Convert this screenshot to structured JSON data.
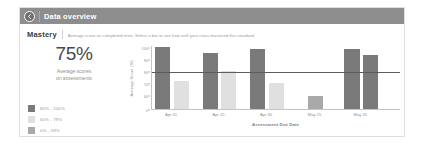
{
  "header": {
    "back_icon": "back-arrow-icon",
    "title": "Data overview"
  },
  "section": {
    "title": "Mastery",
    "description": "Average score on completed tests. Select a bar to see how well your class mastered this standard."
  },
  "summary": {
    "value": "75%",
    "caption_line1": "Average scores",
    "caption_line2": "on assessments"
  },
  "legend": {
    "items": [
      {
        "label": "80% - 100%",
        "color": "#7a7a7a"
      },
      {
        "label": "60% - 79%",
        "color": "#e0e0e0"
      },
      {
        "label": "0% - 59%",
        "color": "#a9a9a9"
      }
    ]
  },
  "chart_data": {
    "type": "bar",
    "title": "",
    "xlabel": "Assessment Due Date",
    "ylabel": "Average Score (%)",
    "ylim": [
      0,
      100
    ],
    "yticks": [
      "100",
      "90",
      "80",
      "70",
      "60",
      "0"
    ],
    "grid": false,
    "legend_position": "left",
    "threshold": 80,
    "categories": [
      "Apr 01",
      "Apr 15",
      "Apr 30",
      "May 15",
      "May 31"
    ],
    "bars": [
      {
        "label": "Apr 01",
        "value": 100,
        "band": "80% - 100%",
        "color": "#7a7a7a"
      },
      {
        "label": "Apr 01",
        "value": 72,
        "band": "60% - 79%",
        "color": "#e0e0e0"
      },
      {
        "label": "Apr 15",
        "value": 95,
        "band": "80% - 100%",
        "color": "#7a7a7a"
      },
      {
        "label": "Apr 15",
        "value": 80,
        "band": "60% - 79%",
        "color": "#e0e0e0"
      },
      {
        "label": "Apr 30",
        "value": 98,
        "band": "80% - 100%",
        "color": "#7a7a7a"
      },
      {
        "label": "Apr 30",
        "value": 70,
        "band": "60% - 79%",
        "color": "#e0e0e0"
      },
      {
        "label": "May 15",
        "value": 57,
        "band": "0% - 59%",
        "color": "#a9a9a9"
      },
      {
        "label": "May 31",
        "value": 98,
        "band": "80% - 100%",
        "color": "#7a7a7a"
      },
      {
        "label": "May 31",
        "value": 93,
        "band": "80% - 100%",
        "color": "#7a7a7a"
      }
    ]
  }
}
